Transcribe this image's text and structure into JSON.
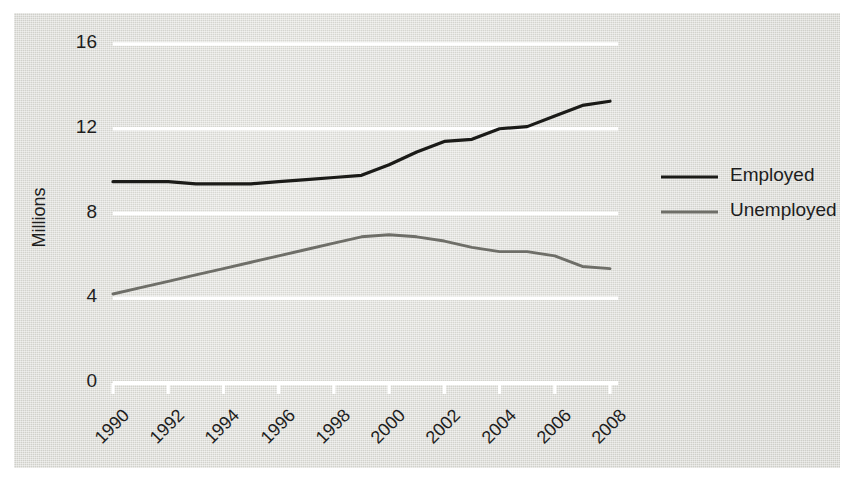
{
  "chart_data": {
    "type": "line",
    "title": "",
    "xlabel": "",
    "ylabel": "Millions",
    "xlim": [
      1990,
      2008
    ],
    "ylim": [
      0,
      16
    ],
    "yticks": [
      0,
      4,
      8,
      12,
      16
    ],
    "ytick_labels": [
      "0",
      "4",
      "8",
      "12",
      "16"
    ],
    "xticks": [
      1990,
      1992,
      1994,
      1996,
      1998,
      2000,
      2002,
      2004,
      2006,
      2008
    ],
    "xtick_labels": [
      "1990",
      "1992",
      "1994",
      "1996",
      "1998",
      "2000",
      "2002",
      "2004",
      "2006",
      "2008"
    ],
    "grid": "horizontal-white",
    "legend_position": "right",
    "x": [
      1990,
      1991,
      1992,
      1993,
      1994,
      1995,
      1996,
      1997,
      1998,
      1999,
      2000,
      2001,
      2002,
      2003,
      2004,
      2005,
      2006,
      2007,
      2008
    ],
    "series": [
      {
        "name": "Employed",
        "color": "#1b1b18",
        "values": [
          9.5,
          9.5,
          9.5,
          9.4,
          9.4,
          9.4,
          9.5,
          9.6,
          9.7,
          9.8,
          10.3,
          10.9,
          11.4,
          11.5,
          12.0,
          12.1,
          12.6,
          13.1,
          13.3
        ]
      },
      {
        "name": "Unemployed",
        "color": "#6e6e68",
        "values": [
          4.2,
          4.5,
          4.8,
          5.1,
          5.4,
          5.7,
          6.0,
          6.3,
          6.6,
          6.9,
          7.0,
          6.9,
          6.7,
          6.4,
          6.2,
          6.2,
          6.0,
          5.5,
          5.4
        ]
      }
    ]
  },
  "legend": {
    "items": [
      {
        "label": "Employed",
        "color": "#1b1b18"
      },
      {
        "label": "Unemployed",
        "color": "#6e6e68"
      }
    ]
  },
  "axes": {
    "y_axis_title": "Millions"
  }
}
